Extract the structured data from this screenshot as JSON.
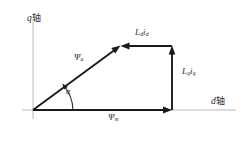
{
  "figure": {
    "type": "phasor-diagram",
    "background_color": "#ffffff",
    "line_color": "#1a1a1a",
    "axis_color": "#b9b9b9",
    "axes": {
      "vertical": {
        "label_symbol": "q",
        "label_suffix": "轴"
      },
      "horizontal": {
        "label_symbol": "d",
        "label_suffix": "轴"
      }
    },
    "vectors": [
      {
        "name": "resultant-flux",
        "symbol": "Ψ",
        "subscript": "a",
        "from": [
          33,
          110
        ],
        "to": [
          120,
          46
        ],
        "direction": "up-right"
      },
      {
        "name": "d-axis-inductance-drop",
        "symbol": "L",
        "subscript": "d",
        "symbol2": "i",
        "subscript2": "d",
        "from": [
          172,
          46
        ],
        "to": [
          120,
          46
        ],
        "direction": "left"
      },
      {
        "name": "q-axis-inductance-drop",
        "symbol": "L",
        "subscript": "q",
        "symbol2": "i",
        "subscript2": "q",
        "from": [
          172,
          110
        ],
        "to": [
          172,
          46
        ],
        "direction": "up"
      },
      {
        "name": "magnet-flux",
        "symbol": "Ψ",
        "subscript": "m",
        "from": [
          33,
          110
        ],
        "to": [
          172,
          110
        ],
        "direction": "right"
      }
    ],
    "angle": {
      "name": "alpha",
      "symbol": "α",
      "between": [
        "magnet-flux",
        "resultant-flux"
      ],
      "vertex": [
        33,
        110
      ]
    }
  }
}
